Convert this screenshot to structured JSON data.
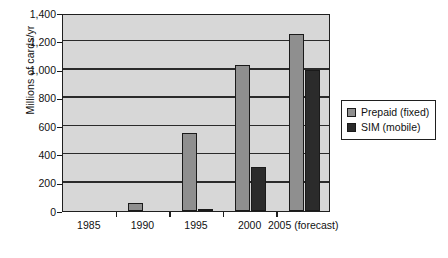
{
  "chart_data": {
    "type": "bar",
    "title": "",
    "subtitle": "",
    "xlabel": "",
    "ylabel": "Millions of cards/yr",
    "categories": [
      "1985",
      "1990",
      "1995",
      "2000",
      "2005 (forecast)"
    ],
    "series": [
      {
        "name": "Prepaid (fixed)",
        "color": "#8f8f8f",
        "values": [
          0,
          60,
          550,
          1030,
          1250
        ]
      },
      {
        "name": "SIM (mobile)",
        "color": "#2b2b2b",
        "values": [
          0,
          0,
          15,
          310,
          1000
        ]
      }
    ],
    "ylim": [
      0,
      1400
    ],
    "ytick_step": 200,
    "ytick_labels": [
      "0",
      "200",
      "400",
      "600",
      "800",
      "1,000",
      "1,200",
      "1,400"
    ],
    "ytick_values": [
      0,
      200,
      400,
      600,
      800,
      1000,
      1200,
      1400
    ],
    "grid": true,
    "grid_axis": "y",
    "legend_position": "right",
    "plot_background": "#d7d7d7",
    "axis_color": "#1f1f1f"
  },
  "legend": {
    "entries": [
      {
        "label": "Prepaid (fixed)",
        "swatch": "prepaid"
      },
      {
        "label": "SIM (mobile)",
        "swatch": "sim"
      }
    ]
  }
}
